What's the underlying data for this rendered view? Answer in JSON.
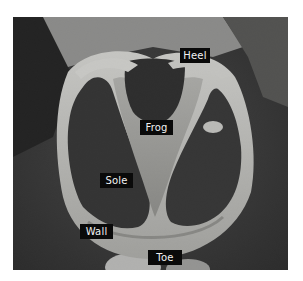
{
  "figure": {
    "colors": {
      "background": "#2a2a2a",
      "wall": "#c8c8c4",
      "sole": "#262626",
      "frog": "#9a9a96",
      "label_bg": "#0a0a0a",
      "label_text": "#f2f2f2"
    },
    "labels": [
      {
        "text": "Heel",
        "x": 180,
        "y": 48,
        "w": 30
      },
      {
        "text": "Frog",
        "x": 140,
        "y": 120,
        "w": 33
      },
      {
        "text": "Sole",
        "x": 100,
        "y": 173,
        "w": 33
      },
      {
        "text": "Wall",
        "x": 80,
        "y": 224,
        "w": 33
      },
      {
        "text": "Toe",
        "x": 148,
        "y": 250,
        "w": 34
      }
    ]
  }
}
